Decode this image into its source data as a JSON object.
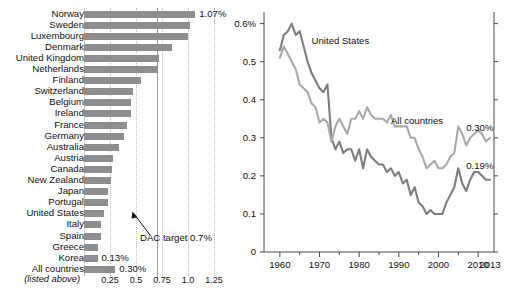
{
  "chart_data": [
    {
      "type": "bar",
      "orientation": "horizontal",
      "title": "",
      "xlabel": "",
      "ylabel": "",
      "xlim": [
        0,
        1.35
      ],
      "grid": true,
      "xticks": [
        "0.25",
        "0.5",
        "0.75",
        "1.0",
        "1.25"
      ],
      "xtick_values": [
        0.25,
        0.5,
        0.75,
        1.0,
        1.25
      ],
      "reference_line": {
        "value": 0.7,
        "label": "DAC target 0.7%"
      },
      "footnote": "(listed above)",
      "categories": [
        "Norway",
        "Sweden",
        "Luxembourg",
        "Denmark",
        "United Kingdom",
        "Netherlands",
        "Finland",
        "Switzerland",
        "Belgium",
        "Ireland",
        "France",
        "Germany",
        "Australia",
        "Austria",
        "Canada",
        "New Zealand",
        "Japan",
        "Portugal",
        "United States",
        "Italy",
        "Spain",
        "Greece",
        "Korea",
        "All countries"
      ],
      "values": [
        1.07,
        1.02,
        1.0,
        0.85,
        0.72,
        0.71,
        0.55,
        0.47,
        0.45,
        0.45,
        0.41,
        0.38,
        0.34,
        0.28,
        0.27,
        0.26,
        0.23,
        0.23,
        0.19,
        0.16,
        0.16,
        0.13,
        0.13,
        0.3
      ],
      "labeled_points": [
        {
          "category": "Norway",
          "label": "1.07%"
        },
        {
          "category": "Korea",
          "label": "0.13%"
        },
        {
          "category": "All countries",
          "label": "0.30%"
        }
      ]
    },
    {
      "type": "line",
      "title": "",
      "xlabel": "",
      "ylabel": "",
      "xlim": [
        1956,
        2013
      ],
      "ylim": [
        0,
        0.62
      ],
      "grid": false,
      "yticks": [
        "0",
        "0.1",
        "0.2",
        "0.3",
        "0.4",
        "0.5",
        "0.6%"
      ],
      "ytick_values": [
        0,
        0.1,
        0.2,
        0.3,
        0.4,
        0.5,
        0.6
      ],
      "xticks": [
        "1960",
        "1970",
        "1980",
        "1990",
        "2000",
        "2010",
        "2013"
      ],
      "xtick_values": [
        1960,
        1970,
        1980,
        1990,
        2000,
        2010,
        2013
      ],
      "minor_xtick_step": 5,
      "annotations": [
        {
          "text": "United States",
          "x": 1968,
          "y": 0.555
        },
        {
          "text": "All countries",
          "x": 1988,
          "y": 0.345
        },
        {
          "text": "0.30%",
          "x": 2007,
          "y": 0.325
        },
        {
          "text": "0.19%",
          "x": 2007,
          "y": 0.225
        }
      ],
      "series": [
        {
          "name": "United States",
          "color": "#7d7d7d",
          "x": [
            1960,
            1961,
            1962,
            1963,
            1964,
            1965,
            1966,
            1967,
            1968,
            1969,
            1970,
            1971,
            1972,
            1973,
            1974,
            1975,
            1976,
            1977,
            1978,
            1979,
            1980,
            1981,
            1982,
            1983,
            1984,
            1985,
            1986,
            1987,
            1988,
            1989,
            1990,
            1991,
            1992,
            1993,
            1994,
            1995,
            1996,
            1997,
            1998,
            1999,
            2000,
            2001,
            2002,
            2003,
            2004,
            2005,
            2006,
            2007,
            2008,
            2009,
            2010,
            2011,
            2012,
            2013
          ],
          "values": [
            0.53,
            0.57,
            0.58,
            0.6,
            0.57,
            0.58,
            0.54,
            0.5,
            0.47,
            0.45,
            0.43,
            0.42,
            0.44,
            0.3,
            0.27,
            0.29,
            0.26,
            0.27,
            0.27,
            0.24,
            0.27,
            0.22,
            0.27,
            0.25,
            0.24,
            0.23,
            0.23,
            0.21,
            0.22,
            0.2,
            0.21,
            0.18,
            0.19,
            0.15,
            0.17,
            0.13,
            0.12,
            0.1,
            0.11,
            0.1,
            0.1,
            0.1,
            0.13,
            0.15,
            0.17,
            0.22,
            0.18,
            0.16,
            0.19,
            0.21,
            0.21,
            0.2,
            0.19,
            0.19
          ]
        },
        {
          "name": "All countries",
          "color": "#a9a9a9",
          "x": [
            1960,
            1961,
            1962,
            1963,
            1964,
            1965,
            1966,
            1967,
            1968,
            1969,
            1970,
            1971,
            1972,
            1973,
            1974,
            1975,
            1976,
            1977,
            1978,
            1979,
            1980,
            1981,
            1982,
            1983,
            1984,
            1985,
            1986,
            1987,
            1988,
            1989,
            1990,
            1991,
            1992,
            1993,
            1994,
            1995,
            1996,
            1997,
            1998,
            1999,
            2000,
            2001,
            2002,
            2003,
            2004,
            2005,
            2006,
            2007,
            2008,
            2009,
            2010,
            2011,
            2012,
            2013
          ],
          "values": [
            0.51,
            0.54,
            0.52,
            0.5,
            0.48,
            0.44,
            0.43,
            0.42,
            0.39,
            0.38,
            0.34,
            0.35,
            0.34,
            0.29,
            0.33,
            0.35,
            0.33,
            0.31,
            0.35,
            0.35,
            0.37,
            0.35,
            0.38,
            0.36,
            0.35,
            0.35,
            0.35,
            0.34,
            0.36,
            0.33,
            0.33,
            0.33,
            0.33,
            0.3,
            0.3,
            0.27,
            0.25,
            0.22,
            0.23,
            0.24,
            0.22,
            0.22,
            0.23,
            0.25,
            0.26,
            0.33,
            0.31,
            0.28,
            0.3,
            0.31,
            0.32,
            0.31,
            0.29,
            0.3
          ]
        }
      ]
    }
  ],
  "barchart": {
    "footnote": "(listed above)",
    "dac_label": "DAC target 0.7%",
    "axis_labels": [
      "0.25",
      "0.5",
      "0.75",
      "1.0",
      "1.25"
    ]
  },
  "linechart": {
    "y_labels": [
      "0.6%",
      "0.5",
      "0.4",
      "0.3",
      "0.2",
      "0.1",
      "0"
    ],
    "x_labels": [
      "1960",
      "1970",
      "1980",
      "1990",
      "2000",
      "2010",
      "2013"
    ],
    "series_labels": [
      "United States",
      "All countries"
    ],
    "end_labels": [
      "0.30%",
      "0.19%"
    ]
  },
  "colors": {
    "bar_fill": "#8e8e8e",
    "line_us": "#7d7d7d",
    "line_all": "#a9a9a9",
    "grid": "#bdbdbd",
    "target_line": "#9a9a9a",
    "text": "#111111",
    "background": "#ffffff"
  }
}
